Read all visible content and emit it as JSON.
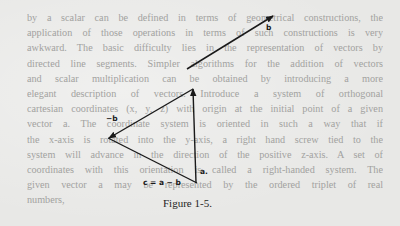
{
  "page": {
    "body_lines": [
      "by a scalar can be defined in terms of geometrical constructions, the",
      "application of those operations in terms of such constructions is very",
      "awkward. The basic difficulty lies in the representation of vectors by",
      "directed line segments. Simpler algorithms for the addition of vectors",
      "and scalar multiplication can be obtained by introducing a more",
      "elegant description of vectors. Introduce a system of orthogonal",
      "cartesian coordinates (x, y, z) with origin at the initial point of a given",
      "vector a. The coordinate system is oriented in such a way that if",
      "the x-axis is rotated into the y-axis, a right hand screw tied to the",
      "system will advance in the direction of the positive z-axis. A set of",
      "coordinates with this orientation is called a right-handed system. The",
      "given vector a may be represented by the ordered triplet of real",
      "numbers,"
    ],
    "figure": {
      "caption": "Figure 1-5.",
      "labels": {
        "b": "b",
        "neg_b": "−b",
        "a": "a.",
        "c": "c = a − b"
      }
    },
    "colors": {
      "background": "#e8e8e6",
      "body_text": "#a2a2a0",
      "figure_ink": "#1a1a1a"
    }
  }
}
